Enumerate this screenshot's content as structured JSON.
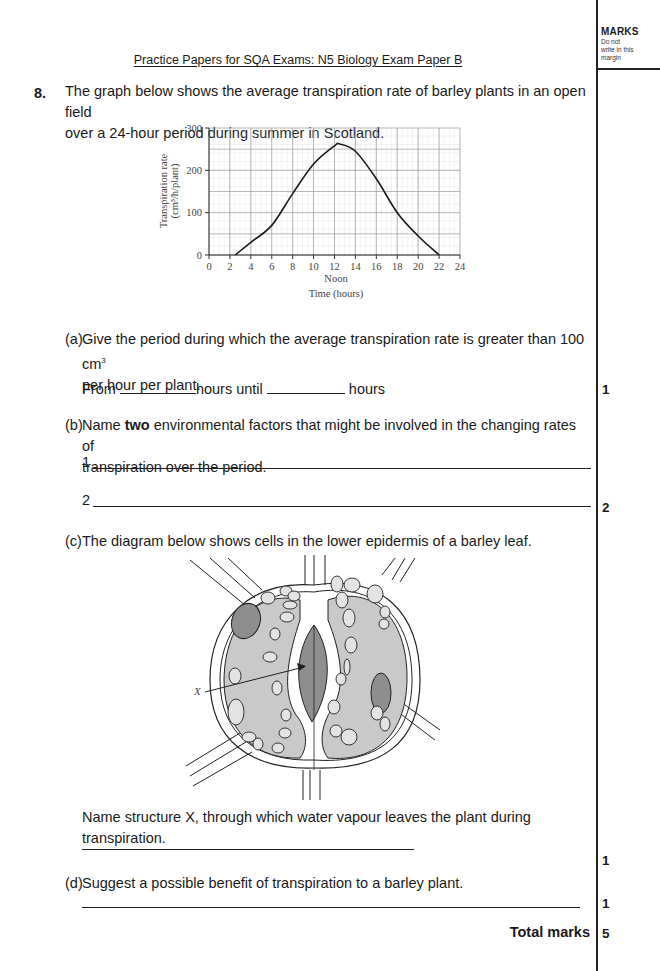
{
  "header": {
    "title": "Practice Papers for SQA Exams: N5 Biology Exam Paper B"
  },
  "margin": {
    "heading": "MARKS",
    "note_line1": "Do not",
    "note_line2": "write in this",
    "note_line3": "margin"
  },
  "question": {
    "number": "8.",
    "stem_line1": "The graph below shows the average transpiration rate of barley plants in an open field",
    "stem_line2": "over a 24-hour period during summer in Scotland."
  },
  "chart_data": {
    "type": "line",
    "title": "",
    "xlabel": "Time (hours)",
    "xlabel_note": "Noon",
    "ylabel": "Transpiration rate",
    "ylabel_units": "(cm³/h/plant)",
    "xlim": [
      0,
      24
    ],
    "ylim": [
      0,
      300
    ],
    "x_ticks": [
      0,
      2,
      4,
      6,
      8,
      10,
      12,
      14,
      16,
      18,
      20,
      22,
      24
    ],
    "y_ticks": [
      0,
      100,
      200,
      300
    ],
    "grid": true,
    "x": [
      2.5,
      4,
      6,
      8,
      10,
      12,
      12.5,
      14,
      16,
      18,
      20,
      22
    ],
    "values": [
      0,
      30,
      70,
      145,
      215,
      258,
      262,
      245,
      180,
      100,
      45,
      0
    ]
  },
  "parts": {
    "a": {
      "label": "(a)",
      "line1": "Give the period during which the average transpiration rate is greater than 100 cm",
      "sup": "3",
      "line2": "per hour per plant.",
      "from": "From",
      "hours_until": "hours until",
      "hours": "hours",
      "marks": "1"
    },
    "b": {
      "label": "(b)",
      "line1_pre": "Name ",
      "line1_bold": "two",
      "line1_post": " environmental factors that might be involved in the changing rates of",
      "line2": "transpiration over the period.",
      "answer1": "1",
      "answer2": "2",
      "marks": "2"
    },
    "c": {
      "label": "(c)",
      "line1": "The diagram below shows cells in the lower epidermis of a barley leaf.",
      "diagram_label": "X",
      "question": "Name structure X, through which water vapour leaves the plant during transpiration.",
      "marks": "1"
    },
    "d": {
      "label": "(d)",
      "line1": "Suggest a possible benefit of transpiration to a barley plant.",
      "marks": "1"
    }
  },
  "total": {
    "label": "Total marks",
    "value": "5"
  }
}
